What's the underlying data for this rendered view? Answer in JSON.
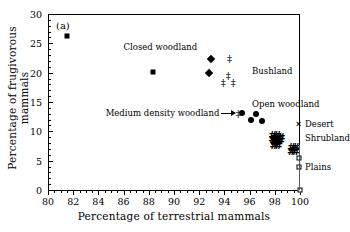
{
  "figure": {
    "panel_label": "(a)",
    "background": "#ffffff",
    "foreground": "#000000"
  },
  "chart_data": {
    "type": "scatter",
    "title": "",
    "panel": "(a)",
    "xlabel": "Percentage of terrestrial mammals",
    "ylabel": "Percentage of frugivorous mammals",
    "xlim": [
      80,
      100
    ],
    "ylim": [
      0,
      30
    ],
    "xticks": [
      80,
      82,
      84,
      86,
      88,
      90,
      92,
      94,
      96,
      98,
      100
    ],
    "yticks": [
      0,
      5,
      10,
      15,
      20,
      25,
      30
    ],
    "xtick_minor_step": 0.5,
    "grid": false,
    "legend": "none (inline annotations)",
    "series": [
      {
        "name": "Closed woodland",
        "marker": "filled-square",
        "points": [
          [
            81.5,
            26.2
          ],
          [
            88.3,
            20.1
          ]
        ]
      },
      {
        "name": "Medium density woodland",
        "marker": "filled-diamond",
        "points": [
          [
            92.9,
            22.3
          ],
          [
            92.8,
            20.0
          ]
        ]
      },
      {
        "name": "Bushland",
        "marker": "double-dagger",
        "points": [
          [
            94.4,
            22.4
          ],
          [
            94.3,
            19.5
          ],
          [
            93.9,
            18.2
          ],
          [
            94.7,
            18.2
          ],
          [
            95.1,
            13.0
          ]
        ]
      },
      {
        "name": "Open woodland",
        "marker": "filled-circle",
        "points": [
          [
            95.4,
            13.2
          ],
          [
            96.5,
            13.0
          ],
          [
            96.1,
            12.0
          ],
          [
            97.0,
            11.8
          ]
        ]
      },
      {
        "name": "Shrubland",
        "marker": "hash-cluster",
        "points": [
          [
            98.0,
            9.0
          ],
          [
            98.3,
            8.8
          ],
          [
            98.1,
            8.0
          ],
          [
            99.5,
            7.0
          ]
        ]
      },
      {
        "name": "Desert",
        "marker": "cross",
        "points": [
          [
            99.9,
            11.3
          ]
        ]
      },
      {
        "name": "Plains",
        "marker": "open-square",
        "points": [
          [
            99.9,
            5.5
          ],
          [
            99.9,
            3.9
          ],
          [
            100.0,
            0.0
          ]
        ]
      }
    ],
    "annotations": [
      {
        "text": "Closed woodland",
        "x": 86.0,
        "y": 24.4,
        "align": "left"
      },
      {
        "text": "Bushland",
        "x": 96.2,
        "y": 20.3,
        "align": "left"
      },
      {
        "text": "Open woodland",
        "x": 96.2,
        "y": 14.7,
        "align": "left"
      },
      {
        "text": "Medium density woodland",
        "x": 93.6,
        "y": 13.1,
        "align": "right",
        "leader": true
      },
      {
        "text": "Desert",
        "x": 100.4,
        "y": 11.3,
        "align": "left"
      },
      {
        "text": "Shrubland",
        "x": 100.4,
        "y": 8.8,
        "align": "left"
      },
      {
        "text": "Plains",
        "x": 100.4,
        "y": 4.0,
        "align": "left"
      }
    ]
  }
}
